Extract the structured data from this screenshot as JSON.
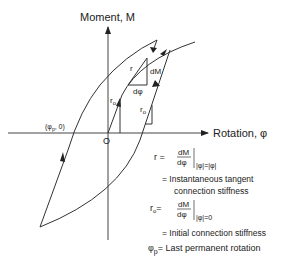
{
  "diagram": {
    "axes": {
      "y_label": "Moment, M",
      "x_label": "Rotation, φ",
      "origin_label": "O"
    },
    "point_labels": {
      "phi_p_point": "(φp , 0)",
      "phi_p_symbol": "φ",
      "phi_p_sub": "p",
      "phi_p_coord": ", 0)"
    },
    "triangle_labels": {
      "r": "r",
      "dM": "dM",
      "dphi": "dφ",
      "r0_left": "r",
      "r0_left_sub": "o",
      "r0_right": "r",
      "r0_right_sub": "o"
    },
    "definitions": {
      "r_lhs": "r  =",
      "r_num": "dM",
      "r_den": "dφ",
      "r_eval": "|φ|=|φ|",
      "r_desc_line1": "= Instantaneous tangent",
      "r_desc_line2": "connection stiffness",
      "r0_lhs": "r",
      "r0_lhs_sub": "o",
      "r0_eq": "=",
      "r0_num": "dM",
      "r0_den": "dφ",
      "r0_eval": "|φ|=0",
      "r0_desc": "= Initial connection stiffness",
      "phip_lhs": "φ",
      "phip_sub": "p",
      "phip_desc": "= Last permanent rotation"
    },
    "colors": {
      "line": "#333333",
      "text": "#222222",
      "background": "#ffffff"
    }
  }
}
